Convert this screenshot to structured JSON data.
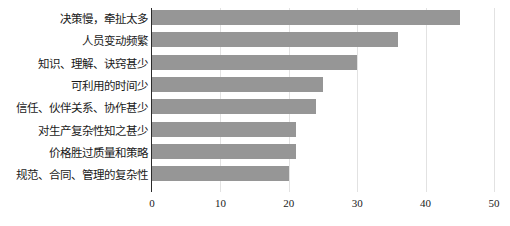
{
  "chart_data": {
    "type": "bar",
    "orientation": "horizontal",
    "title": "",
    "subtitle": "",
    "xlabel": "",
    "ylabel": "",
    "categories": [
      "决策慢，牵扯太多",
      "人员变动频繁",
      "知识、理解、诀窍甚少",
      "可利用的时间少",
      "信任、伙伴关系、协作甚少",
      "对生产复杂性知之甚少",
      "价格胜过质量和策略",
      "规范、合同、管理的复杂性"
    ],
    "values": [
      45,
      36,
      30,
      25,
      24,
      21,
      21,
      20
    ],
    "xlim": [
      0,
      50
    ],
    "xticks": [
      0,
      10,
      20,
      30,
      40,
      50
    ],
    "xtick_labels": [
      "0",
      "10",
      "20",
      "30",
      "40",
      "50"
    ],
    "grid": true,
    "grid_axis": "x",
    "legend": false,
    "legend_position": "none",
    "bar_color": "#969696",
    "gridline_color": "#e2e2e2",
    "axis_color": "#2b2b2b",
    "background_color": "#ffffff",
    "text_color": "#1a1a1a",
    "annotations": []
  }
}
